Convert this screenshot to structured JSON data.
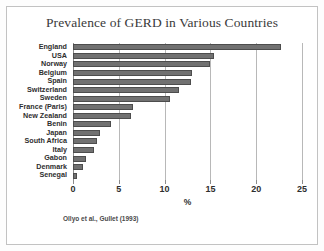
{
  "figure": {
    "title": "Prevalence of GERD in Various Countries",
    "source_note": "Ollyo et al., Gullet (1993)",
    "frame_color": "#c2c2c2",
    "bar_color": "#717171",
    "bar_edge_color": "#4d4d4d",
    "gridline_color": "#b8b8b8",
    "text_color": "#2e2e2e"
  },
  "chart_data": {
    "type": "bar",
    "orientation": "horizontal",
    "title": "Prevalence of GERD in Various Countries",
    "xlabel": "%",
    "ylabel": "",
    "xlim": [
      0,
      25
    ],
    "xticks": [
      0,
      5,
      10,
      15,
      20,
      25
    ],
    "xtick_labels": [
      "0",
      "5",
      "10",
      "15",
      "20",
      "25"
    ],
    "grid": true,
    "grid_axis": "x",
    "legend": false,
    "annotations": [
      "Ollyo et al., Gullet (1993)"
    ],
    "categories": [
      "England",
      "USA",
      "Norway",
      "Belgium",
      "Spain",
      "Switzerland",
      "Sweden",
      "France (Paris)",
      "New Zealand",
      "Benin",
      "Japan",
      "South Africa",
      "Italy",
      "Gabon",
      "Denmark",
      "Senegal"
    ],
    "values": [
      22.7,
      15.4,
      15.0,
      13.0,
      12.9,
      11.6,
      10.6,
      6.6,
      6.3,
      4.2,
      3.0,
      2.6,
      2.3,
      1.4,
      1.1,
      0.4
    ]
  }
}
